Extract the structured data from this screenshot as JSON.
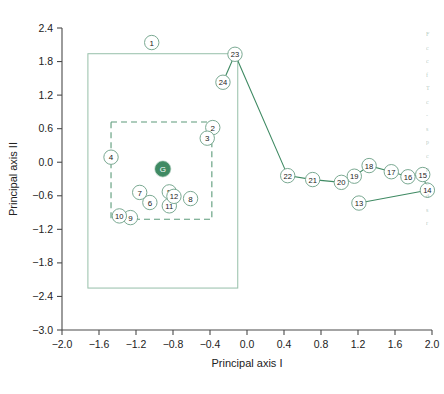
{
  "chart_data": {
    "type": "scatter",
    "title": "",
    "xlabel": "Principal axis I",
    "ylabel": "Principal axis II",
    "xlim": [
      -2.0,
      2.0
    ],
    "ylim": [
      -3.0,
      2.4
    ],
    "xticks": [
      "-2.0",
      "-1.6",
      "-1.2",
      "-0.8",
      "-0.4",
      "0.0",
      "0.4",
      "0.8",
      "1.2",
      "1.6",
      "2.0"
    ],
    "xtick_values": [
      -2.0,
      -1.6,
      -1.2,
      -0.8,
      -0.4,
      0.0,
      0.4,
      0.8,
      1.2,
      1.6,
      2.0
    ],
    "yticks": [
      "2.4",
      "1.8",
      "1.2",
      "0.6",
      "0.0",
      "-0.6",
      "-1.2",
      "-1.8",
      "-2.4",
      "-3.0"
    ],
    "ytick_values": [
      2.4,
      1.8,
      1.2,
      0.6,
      0.0,
      -0.6,
      -1.2,
      -1.8,
      -2.4,
      -3.0
    ],
    "grid": false,
    "legend": "none",
    "accent_color": "#3f8a63",
    "marker_color": "#ffffff",
    "marker_edge_color": "#7aa992",
    "label_color": "#222222",
    "points": [
      {
        "label": "1",
        "x": -1.03,
        "y": 2.14
      },
      {
        "label": "2",
        "x": -0.37,
        "y": 0.62
      },
      {
        "label": "3",
        "x": -0.43,
        "y": 0.43
      },
      {
        "label": "4",
        "x": -1.47,
        "y": 0.09
      },
      {
        "label": "5",
        "x": -0.84,
        "y": -0.53
      },
      {
        "label": "6",
        "x": -1.05,
        "y": -0.72
      },
      {
        "label": "7",
        "x": -1.16,
        "y": -0.54
      },
      {
        "label": "8",
        "x": -0.61,
        "y": -0.65
      },
      {
        "label": "9",
        "x": -1.26,
        "y": -0.99
      },
      {
        "label": "10",
        "x": -1.38,
        "y": -0.96
      },
      {
        "label": "11",
        "x": -0.84,
        "y": -0.78
      },
      {
        "label": "12",
        "x": -0.79,
        "y": -0.61
      },
      {
        "label": "13",
        "x": 1.21,
        "y": -0.73
      },
      {
        "label": "14",
        "x": 1.95,
        "y": -0.5
      },
      {
        "label": "15",
        "x": 1.9,
        "y": -0.22
      },
      {
        "label": "16",
        "x": 1.74,
        "y": -0.26
      },
      {
        "label": "17",
        "x": 1.56,
        "y": -0.17
      },
      {
        "label": "18",
        "x": 1.32,
        "y": -0.06
      },
      {
        "label": "19",
        "x": 1.16,
        "y": -0.25
      },
      {
        "label": "20",
        "x": 1.02,
        "y": -0.36
      },
      {
        "label": "21",
        "x": 0.71,
        "y": -0.31
      },
      {
        "label": "22",
        "x": 0.44,
        "y": -0.24
      },
      {
        "label": "23",
        "x": -0.13,
        "y": 1.93
      },
      {
        "label": "24",
        "x": -0.26,
        "y": 1.43
      },
      {
        "label": "G",
        "x": -0.91,
        "y": -0.12,
        "filled": true
      }
    ],
    "paths": [
      {
        "name": "trajectory-main",
        "points": [
          "23",
          "22",
          "21",
          "20",
          "19",
          "18",
          "17",
          "16",
          "15",
          "14"
        ]
      },
      {
        "name": "trajectory-13-to-14",
        "points": [
          "13",
          "14"
        ],
        "arrow": true
      },
      {
        "name": "arrow-23-to-24",
        "points": [
          "23",
          "24"
        ],
        "arrow": true
      }
    ],
    "boxes": [
      {
        "name": "outer-solid-box",
        "style": "solid",
        "x0": -1.72,
        "y0": -2.25,
        "x1": -0.1,
        "y1": 1.94
      },
      {
        "name": "inner-dashed-box",
        "style": "dashed",
        "x0": -1.47,
        "y0": -1.02,
        "x1": -0.38,
        "y1": 0.72
      }
    ]
  },
  "side_caption": {
    "lines": [
      "F",
      "c",
      "c",
      "f",
      "T",
      "c",
      "-",
      "s",
      "p",
      "c",
      "p",
      "c",
      "d",
      "s",
      "r"
    ]
  }
}
